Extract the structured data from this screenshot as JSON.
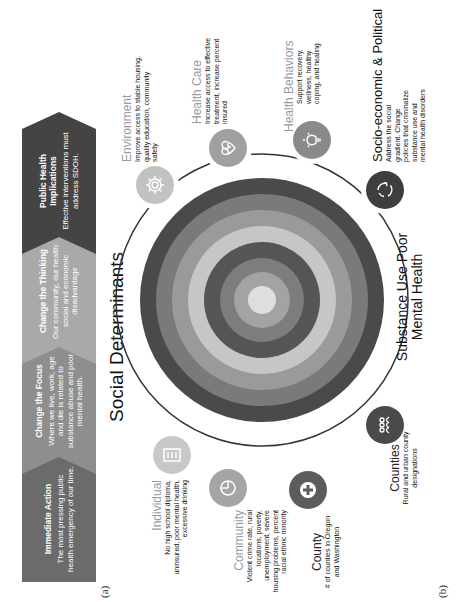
{
  "panel_a": {
    "label": "(a)",
    "steps": [
      {
        "title": "Immediate Action",
        "description": "The most pressing public health emergency of our time.",
        "color": "#6b6b6b"
      },
      {
        "title": "Change the Focus",
        "description": "Where we live, work, age and die is related to substance abuse and poor mental health.",
        "color": "#8e8e8e"
      },
      {
        "title": "Change the Thinking",
        "description": "Our community, our health: social and economic disadvantage",
        "color": "#a9a9a9"
      },
      {
        "title": "Public Health Implications",
        "description": "Effective interventions must address SDOH.",
        "color": "#444444"
      }
    ]
  },
  "panel_b": {
    "label": "(b)",
    "title": "Social Determinants",
    "center_label": "Substance Use Poor Mental Health",
    "rings": [
      "#4a4a4a",
      "#7a7a7a",
      "#9a9a9a",
      "#c6c6c6",
      "#555555",
      "#7d7d7d",
      "#a3a3a3",
      "#dedede"
    ],
    "nodes": [
      {
        "name": "Individual",
        "description": "No high school diploma, uninsured, poor mental health, excessive drinking",
        "icon": "checklist-icon",
        "color": "#c8c8c8"
      },
      {
        "name": "Community",
        "description": "Violent crime rate, rural locations, poverty, unemployment, severe housing problems, percent racial ethnic minority",
        "icon": "pie-chart-icon",
        "color": "#a5a5a5"
      },
      {
        "name": "County",
        "description": "# of counties in Oregon and Washington",
        "icon": "plus-cross-icon",
        "color": "#5c5c5c"
      },
      {
        "name": "Counties",
        "description": "Rural and urban county designations",
        "icon": "people-group-icon",
        "color": "#4a4a4a"
      },
      {
        "name": "Environment",
        "description": "Improve access to stable housing, quality education, community safety",
        "icon": "gear-icon",
        "color": "#c2c2c2"
      },
      {
        "name": "Health Care",
        "description": "Increase access to effective treatment, increase percent insured",
        "icon": "heart-pulse-icon",
        "color": "#a0a0a0"
      },
      {
        "name": "Health Behaviors",
        "description": "Support recovery, wellness, healthy coping, and healing",
        "icon": "lightbulb-icon",
        "color": "#8a8a8a"
      },
      {
        "name": "Socio-economic & Political",
        "description": "Address the social gradient. Change policies that criminalize substance use and mental health disorders",
        "icon": "cycle-arrows-icon",
        "color": "#3e3e3e"
      }
    ]
  }
}
